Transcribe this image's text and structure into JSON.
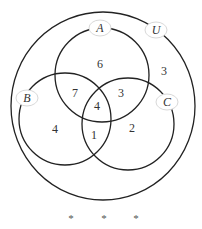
{
  "diagram": {
    "type": "venn",
    "universe": {
      "label": "U",
      "outside_value": "3"
    },
    "sets": [
      {
        "label": "A",
        "only": "6"
      },
      {
        "label": "B",
        "only": "4"
      },
      {
        "label": "C",
        "only": "2"
      }
    ],
    "regions": {
      "A_only": "6",
      "B_only": "4",
      "C_only": "2",
      "A_and_B_only": "7",
      "A_and_C_only": "3",
      "B_and_C_only": "1",
      "A_and_B_and_C": "4",
      "outside": "3"
    },
    "separator": [
      "*",
      "*",
      "*"
    ]
  }
}
